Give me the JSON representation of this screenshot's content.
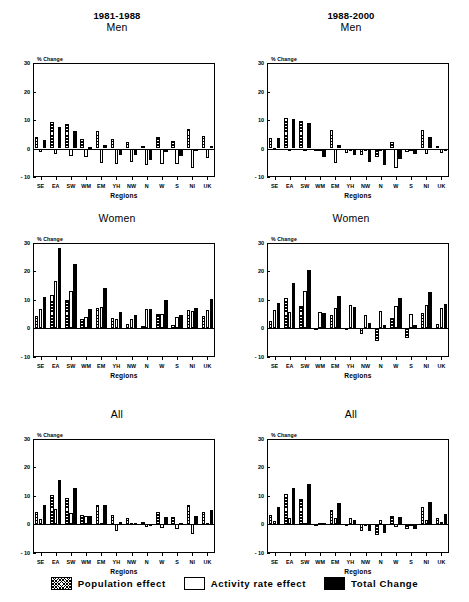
{
  "figure": {
    "xlabel": "Regions",
    "ylabel": "% Change",
    "yticks": [
      "30",
      "20",
      "10",
      "0",
      "- 10"
    ],
    "regions": [
      "SE",
      "EA",
      "SW",
      "WM",
      "EM",
      "YH",
      "NW",
      "N",
      "W",
      "S",
      "NI",
      "UK"
    ]
  },
  "legend": {
    "items": [
      {
        "label": "Population effect",
        "swatch": "cross-hatch",
        "color": "#000000"
      },
      {
        "label": "Activity rate effect",
        "swatch": "white-fill",
        "color": "#ffffff"
      },
      {
        "label": "Total Change",
        "swatch": "solid-black",
        "color": "#000000"
      }
    ]
  },
  "panels": [
    {
      "period": "1981-1988",
      "sex": "Men",
      "show_period": true
    },
    {
      "period": "1988-2000",
      "sex": "Men",
      "show_period": true
    },
    {
      "period": "1981-1988",
      "sex": "Women",
      "show_period": false
    },
    {
      "period": "1988-2000",
      "sex": "Women",
      "show_period": false
    },
    {
      "period": "1981-1988",
      "sex": "All",
      "show_period": false
    },
    {
      "period": "1988-2000",
      "sex": "All",
      "show_period": false
    }
  ],
  "chart_data": [
    {
      "type": "bar",
      "title": "1981-1988 Men",
      "period": "1981-1988",
      "group": "Men",
      "xlabel": "Regions",
      "ylabel": "% Change",
      "ylim": [
        -10,
        30
      ],
      "yticks": [
        -10,
        0,
        10,
        20,
        30
      ],
      "grid": false,
      "legend_position": "figure-bottom",
      "categories": [
        "SE",
        "EA",
        "SW",
        "WM",
        "EM",
        "YH",
        "NW",
        "N",
        "W",
        "S",
        "NI",
        "UK"
      ],
      "series": [
        {
          "name": "Population effect",
          "values": [
            4.2,
            9.3,
            8.5,
            3.5,
            6.3,
            3.2,
            2.3,
            0.8,
            4.0,
            2.8,
            6.8,
            4.3
          ]
        },
        {
          "name": "Activity rate effect",
          "values": [
            -1.3,
            -1.8,
            -2.5,
            -3.0,
            -5.2,
            -5.5,
            -4.8,
            -5.7,
            -5.5,
            -5.5,
            -6.8,
            -3.2
          ]
        },
        {
          "name": "Total Change",
          "values": [
            2.9,
            7.4,
            6.1,
            0.7,
            1.2,
            -2.2,
            -2.3,
            -4.2,
            -1.4,
            -2.6,
            0.0,
            0.9
          ]
        }
      ]
    },
    {
      "type": "bar",
      "title": "1988-2000 Men",
      "period": "1988-2000",
      "group": "Men",
      "xlabel": "Regions",
      "ylabel": "% Change",
      "ylim": [
        -10,
        30
      ],
      "yticks": [
        -10,
        0,
        10,
        20,
        30
      ],
      "grid": false,
      "legend_position": "figure-bottom",
      "categories": [
        "SE",
        "EA",
        "SW",
        "WM",
        "EM",
        "YH",
        "NW",
        "N",
        "W",
        "S",
        "NI",
        "UK"
      ],
      "series": [
        {
          "name": "Population effect",
          "values": [
            3.6,
            10.7,
            9.6,
            -0.9,
            6.4,
            -1.7,
            -2.3,
            -3.0,
            2.3,
            -1.3,
            6.5,
            0.9
          ]
        },
        {
          "name": "Activity rate effect",
          "values": [
            0.2,
            0.0,
            -0.8,
            -0.3,
            -5.2,
            -0.2,
            -0.3,
            -0.2,
            -6.7,
            -0.3,
            -2.1,
            -1.7
          ]
        },
        {
          "name": "Total Change",
          "values": [
            3.7,
            10.5,
            9.1,
            -2.9,
            1.1,
            -2.2,
            -4.6,
            -5.9,
            -3.8,
            -2.0,
            4.1,
            -0.6
          ]
        }
      ]
    },
    {
      "type": "bar",
      "title": "1981-1988 Women",
      "period": "1981-1988",
      "group": "Women",
      "xlabel": "Regions",
      "ylabel": "% Change",
      "ylim": [
        -10,
        30
      ],
      "yticks": [
        -10,
        0,
        10,
        20,
        30
      ],
      "grid": false,
      "legend_position": "figure-bottom",
      "categories": [
        "SE",
        "EA",
        "SW",
        "WM",
        "EM",
        "YH",
        "NW",
        "N",
        "W",
        "S",
        "NI",
        "UK"
      ],
      "series": [
        {
          "name": "Population effect",
          "values": [
            4.3,
            11.5,
            9.8,
            3.2,
            6.9,
            3.4,
            1.5,
            0.7,
            4.8,
            1.2,
            6.2,
            4.3
          ]
        },
        {
          "name": "Activity rate effect",
          "values": [
            6.7,
            16.4,
            13.0,
            3.8,
            7.5,
            3.2,
            3.1,
            6.5,
            4.9,
            4.0,
            6.1,
            6.2
          ]
        },
        {
          "name": "Total Change",
          "values": [
            11.0,
            28.0,
            22.5,
            6.6,
            14.0,
            5.6,
            4.5,
            6.7,
            9.9,
            4.6,
            7.0,
            10.2
          ]
        }
      ]
    },
    {
      "type": "bar",
      "title": "1988-2000 Women",
      "period": "1988-2000",
      "group": "Women",
      "xlabel": "Regions",
      "ylabel": "% Change",
      "ylim": [
        -10,
        30
      ],
      "yticks": [
        -10,
        0,
        10,
        20,
        30
      ],
      "grid": false,
      "legend_position": "figure-bottom",
      "categories": [
        "SE",
        "EA",
        "SW",
        "WM",
        "EM",
        "YH",
        "NW",
        "N",
        "W",
        "S",
        "NI",
        "UK"
      ],
      "series": [
        {
          "name": "Population effect",
          "values": [
            2.5,
            10.4,
            7.8,
            -0.2,
            4.6,
            -0.8,
            -2.1,
            -4.5,
            3.4,
            -3.4,
            5.3,
            1.5
          ]
        },
        {
          "name": "Activity rate effect",
          "values": [
            6.4,
            5.7,
            13.0,
            5.5,
            7.0,
            8.0,
            4.6,
            6.1,
            7.8,
            4.9,
            7.9,
            7.1
          ]
        },
        {
          "name": "Total Change",
          "values": [
            8.7,
            15.8,
            20.4,
            5.4,
            11.2,
            7.2,
            1.9,
            1.1,
            10.6,
            1.0,
            12.5,
            8.4
          ]
        }
      ]
    },
    {
      "type": "bar",
      "title": "1981-1988 All",
      "period": "1981-1988",
      "group": "All",
      "xlabel": "Regions",
      "ylabel": "% Change",
      "ylim": [
        -10,
        30
      ],
      "yticks": [
        -10,
        0,
        10,
        20,
        30
      ],
      "grid": false,
      "legend_position": "figure-bottom",
      "categories": [
        "SE",
        "EA",
        "SW",
        "WM",
        "EM",
        "YH",
        "NW",
        "N",
        "W",
        "S",
        "NI",
        "UK"
      ],
      "series": [
        {
          "name": "Population effect",
          "values": [
            4.3,
            10.1,
            9.0,
            3.2,
            6.5,
            3.2,
            2.0,
            0.8,
            4.3,
            2.5,
            6.7,
            4.3
          ]
        },
        {
          "name": "Activity rate effect",
          "values": [
            1.8,
            5.2,
            4.0,
            2.8,
            0.2,
            -2.6,
            0.3,
            -0.9,
            -1.4,
            -1.9,
            -3.6,
            0.2
          ]
        },
        {
          "name": "Total Change",
          "values": [
            6.5,
            15.4,
            12.8,
            2.9,
            6.5,
            0.8,
            0.3,
            -0.3,
            2.5,
            0.2,
            2.8,
            4.8
          ]
        }
      ]
    },
    {
      "type": "bar",
      "title": "1988-2000 All",
      "period": "1988-2000",
      "group": "All",
      "xlabel": "Regions",
      "ylabel": "% Change",
      "ylim": [
        -10,
        30
      ],
      "yticks": [
        -10,
        0,
        10,
        20,
        30
      ],
      "grid": false,
      "legend_position": "figure-bottom",
      "categories": [
        "SE",
        "EA",
        "SW",
        "WM",
        "EM",
        "YH",
        "NW",
        "N",
        "W",
        "S",
        "NI",
        "UK"
      ],
      "series": [
        {
          "name": "Population effect",
          "values": [
            3.0,
            10.6,
            8.9,
            -0.5,
            5.0,
            -0.7,
            -2.6,
            -3.8,
            2.7,
            -1.9,
            6.0,
            2.1
          ]
        },
        {
          "name": "Activity rate effect",
          "values": [
            1.0,
            2.2,
            0.4,
            0.3,
            2.2,
            2.0,
            -0.2,
            1.3,
            -1.1,
            -0.2,
            1.3,
            0.6
          ]
        },
        {
          "name": "Total Change",
          "values": [
            6.0,
            12.7,
            14.2,
            0.4,
            7.2,
            1.3,
            -2.3,
            -3.2,
            2.5,
            -1.6,
            7.8,
            3.5
          ]
        }
      ]
    }
  ]
}
